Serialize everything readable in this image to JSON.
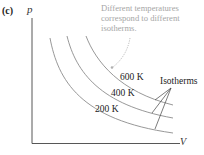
{
  "figure": {
    "panel_label": "(c)",
    "y_axis_label": "p",
    "x_axis_label": "V",
    "annotation": "Different temperatures correspond to different isotherms.",
    "callout_label": "Isotherms",
    "curves": [
      {
        "label": "600 K",
        "temperature_K": 600
      },
      {
        "label": "400 K",
        "temperature_K": 400
      },
      {
        "label": "200 K",
        "temperature_K": 200
      }
    ],
    "colors": {
      "axis": "#444444",
      "curve": "#8c8c8c",
      "annotation_text": "#a6a6a6",
      "label_text": "#222222"
    }
  }
}
